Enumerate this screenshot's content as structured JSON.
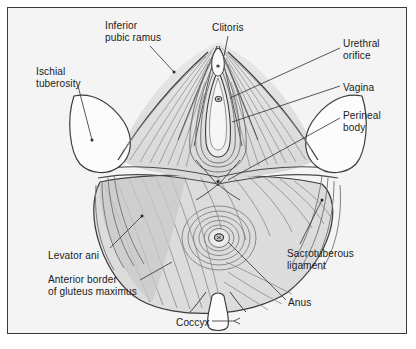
{
  "figure": {
    "border_color": "#3a3a3a",
    "background_color": "#f4f4f4",
    "ink_color": "#1a1a1a",
    "muscle_fill": "#dcdcdc",
    "bone_fill": "#fbfbfb"
  },
  "labels": [
    {
      "id": "inferior-pubic-ramus",
      "text": "Inferior\npubic ramus",
      "x": 105,
      "y": 20,
      "align": "left"
    },
    {
      "id": "clitoris",
      "text": "Clitoris",
      "x": 212,
      "y": 22,
      "align": "left"
    },
    {
      "id": "urethral-orifice",
      "text": "Urethral\norifice",
      "x": 343,
      "y": 38,
      "align": "left"
    },
    {
      "id": "ischial-tuberosity",
      "text": "Ischial\ntuberosity",
      "x": 36,
      "y": 66,
      "align": "left"
    },
    {
      "id": "vagina",
      "text": "Vagina",
      "x": 343,
      "y": 82,
      "align": "left"
    },
    {
      "id": "perineal-body",
      "text": "Perineal\nbody",
      "x": 343,
      "y": 110,
      "align": "left"
    },
    {
      "id": "levator-ani",
      "text": "Levator ani",
      "x": 48,
      "y": 250,
      "align": "left"
    },
    {
      "id": "sacrotuberous-ligament",
      "text": "Sacrotuberous\nligament",
      "x": 287,
      "y": 248,
      "align": "left"
    },
    {
      "id": "anterior-border-gluteus-maximus",
      "text": "Anterior border\nof gluteus maximus",
      "x": 48,
      "y": 274,
      "align": "left"
    },
    {
      "id": "anus",
      "text": "Anus",
      "x": 288,
      "y": 297,
      "align": "left"
    },
    {
      "id": "coccyx",
      "text": "Coccyx",
      "x": 176,
      "y": 317,
      "align": "left"
    }
  ],
  "structures": [
    {
      "id": "urogenital-triangle",
      "name": "Urogenital triangle with bulbospongiosus fibres"
    },
    {
      "id": "anal-triangle",
      "name": "Anal triangle with external anal sphincter"
    },
    {
      "id": "levator-ani-sheet",
      "name": "Levator ani muscle sheet"
    },
    {
      "id": "ischial-tuberosity-left",
      "name": "Left ischial tuberosity"
    },
    {
      "id": "ischial-tuberosity-right",
      "name": "Right ischial tuberosity"
    },
    {
      "id": "coccyx-bone",
      "name": "Coccyx"
    },
    {
      "id": "sacrotuberous-ligament-band",
      "name": "Sacrotuberous ligament fibres"
    },
    {
      "id": "perineal-body-node",
      "name": "Perineal body"
    },
    {
      "id": "vaginal-orifice",
      "name": "Vaginal orifice"
    },
    {
      "id": "urethral-orifice-point",
      "name": "Urethral orifice"
    },
    {
      "id": "anal-orifice",
      "name": "Anal orifice"
    }
  ]
}
